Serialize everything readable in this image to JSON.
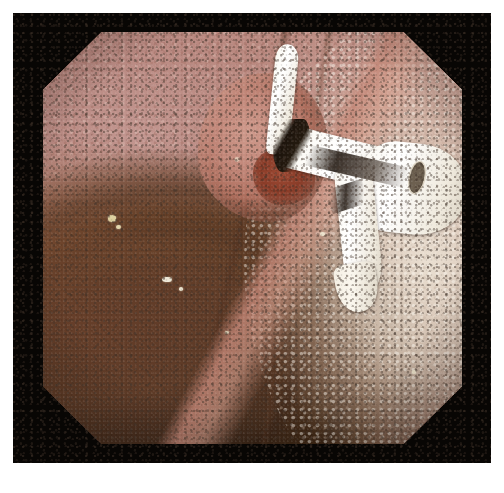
{
  "image": {
    "kind": "endoscopy-photograph",
    "width": 504,
    "height": 493,
    "background_color": "#ffffff",
    "frame_color": "#080604",
    "viewport_shape": "octagon",
    "caption": "",
    "title": ""
  },
  "palette": {
    "white_border": "#ffffff",
    "black_frame": "#080604",
    "mucosa_rose": "#b5837d",
    "mucosa_pale": "#e6dbc8",
    "lumen_dark": "#140d07",
    "fold_brown": "#6e442c",
    "lesion_pink": "#c28779",
    "lesion_erosion_red": "#8a3c28",
    "stent_white": "#fbf8f0",
    "stent_shadow": "#1d140c",
    "debris_cream": "#ece3c8"
  },
  "scene": {
    "regions": [
      {
        "name": "upper-left-mucosa",
        "label": "Rose-pink mucosal wall, upper left"
      },
      {
        "name": "upper-right-mucosa",
        "label": "Granular pale-pink mucosa, upper right"
      },
      {
        "name": "papillary-lesion",
        "label": "Raised nodular papillary lesion with whitish nodules"
      },
      {
        "name": "lesion-orifice",
        "label": "Eroded reddened orifice at lesion centre"
      },
      {
        "name": "indwelling-stent",
        "label": "White plastic indwelling stent protruding from orifice"
      },
      {
        "name": "stent-lumen-opening",
        "label": "Dark lumen opening at distal stent end"
      },
      {
        "name": "pale-mucosa-right",
        "label": "Whitish-cream mucosal surface, right lower quadrant"
      },
      {
        "name": "mid-fold",
        "label": "Brown circumferential mucosal fold"
      },
      {
        "name": "dark-lumen",
        "label": "Dark intestinal lumen, lower left"
      },
      {
        "name": "debris-flecks",
        "label": "Scattered cream mucus and debris flecks"
      }
    ]
  }
}
